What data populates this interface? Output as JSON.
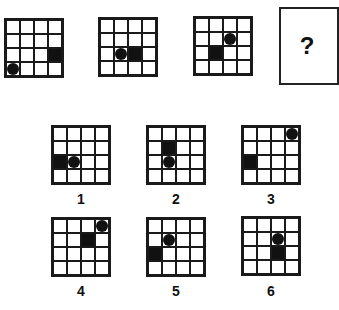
{
  "puzzle": {
    "grid_size": 4,
    "sequence": [
      {
        "circle": [
          4,
          1
        ],
        "square": [
          3,
          4
        ]
      },
      {
        "circle": [
          3,
          2
        ],
        "square": [
          3,
          3
        ]
      },
      {
        "circle": [
          2,
          3
        ],
        "square": [
          3,
          2
        ]
      }
    ],
    "question_mark": "?",
    "options": [
      {
        "label": "1",
        "circle": [
          3,
          2
        ],
        "square": [
          3,
          1
        ]
      },
      {
        "label": "2",
        "circle": [
          3,
          2
        ],
        "square": [
          2,
          2
        ]
      },
      {
        "label": "3",
        "circle": [
          1,
          4
        ],
        "square": [
          3,
          1
        ]
      },
      {
        "label": "4",
        "circle": [
          1,
          4
        ],
        "square": [
          2,
          3
        ]
      },
      {
        "label": "5",
        "circle": [
          2,
          2
        ],
        "square": [
          3,
          1
        ]
      },
      {
        "label": "6",
        "circle": [
          2,
          3
        ],
        "square": [
          3,
          3
        ]
      }
    ]
  }
}
